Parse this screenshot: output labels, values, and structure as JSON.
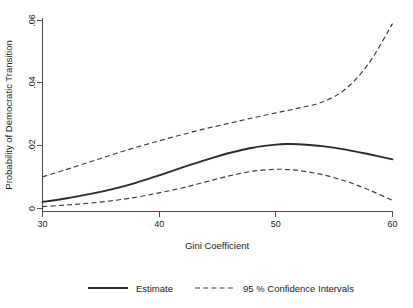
{
  "chart_data": {
    "type": "line",
    "title": "",
    "xlabel": "Gini Coefficient",
    "ylabel": "Probability of Democratic Transition",
    "xlim": [
      30,
      60
    ],
    "ylim": [
      0,
      0.06
    ],
    "xticks": [
      30,
      40,
      50,
      60
    ],
    "xticklabels": [
      "30",
      "40",
      "50",
      "60"
    ],
    "yticks": [
      0,
      0.02,
      0.04,
      0.06
    ],
    "yticklabels": [
      "0",
      ".02",
      ".04",
      ".06"
    ],
    "grid": false,
    "legend_position": "below-axes",
    "x": [
      30,
      32,
      34,
      36,
      38,
      40,
      42,
      44,
      46,
      48,
      50,
      51,
      52,
      54,
      56,
      58,
      60
    ],
    "series": [
      {
        "name": "Estimate",
        "style": "solid",
        "color": "#2b2b2b",
        "values": [
          0.0021,
          0.0032,
          0.0046,
          0.0062,
          0.0082,
          0.0106,
          0.0131,
          0.0155,
          0.0177,
          0.0194,
          0.0204,
          0.0206,
          0.0205,
          0.0199,
          0.0188,
          0.0173,
          0.0157
        ]
      },
      {
        "name": "Upper 95 % Confidence Interval",
        "style": "dashed",
        "color": "#3a3a3a",
        "values": [
          0.0101,
          0.0124,
          0.0148,
          0.0172,
          0.0195,
          0.0216,
          0.0236,
          0.0255,
          0.0272,
          0.0289,
          0.0305,
          0.0313,
          0.0321,
          0.034,
          0.0382,
          0.0465,
          0.059
        ]
      },
      {
        "name": "Lower 95 % Confidence Interval",
        "style": "dashed",
        "color": "#3a3a3a",
        "values": [
          0.0006,
          0.0011,
          0.0017,
          0.0025,
          0.0036,
          0.005,
          0.0066,
          0.0085,
          0.0104,
          0.0119,
          0.0125,
          0.0124,
          0.0121,
          0.0108,
          0.0087,
          0.0059,
          0.0026
        ]
      }
    ],
    "legend": [
      {
        "label": "Estimate",
        "style": "solid"
      },
      {
        "label": "95 % Confidence Intervals",
        "style": "dashed"
      }
    ]
  },
  "axes": {
    "x_title": "Gini Coefficient",
    "y_title": "Probability of Democratic Transition",
    "x_tick_labels": [
      "30",
      "40",
      "50",
      "60"
    ],
    "y_tick_labels": [
      "0",
      ".02",
      ".04",
      ".06"
    ]
  },
  "legend": {
    "estimate_label": "Estimate",
    "ci_label": "95 % Confidence Intervals"
  },
  "colors": {
    "estimate": "#2b2b2b",
    "confidence_interval": "#3a3a3a",
    "axis": "#4d4d4d",
    "background": "#ffffff",
    "text": "#1a1a1a"
  }
}
